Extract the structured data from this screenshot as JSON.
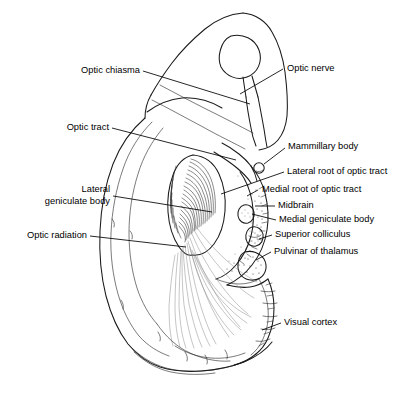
{
  "figure": {
    "background_color": "#ffffff",
    "line_color": "#1a1a1a",
    "text_color": "#000000",
    "width": 416,
    "height": 393
  },
  "labels": {
    "optic_chiasma": "Optic chiasma",
    "optic_nerve": "Optic nerve",
    "optic_tract": "Optic tract",
    "mammillary_body": "Mammillary body",
    "lateral_root": "Lateral root of optic tract",
    "medial_root": "Medial root of optic tract",
    "midbrain": "Midbrain",
    "medial_geniculate": "Medial geniculate body",
    "lateral_geniculate_line1": "Lateral",
    "lateral_geniculate_line2": "geniculate body",
    "superior_colliculus": "Superior colliculus",
    "optic_radiation": "Optic radiation",
    "pulvinar": "Pulvinar of thalamus",
    "visual_cortex": "Visual cortex"
  }
}
